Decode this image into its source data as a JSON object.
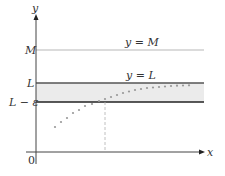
{
  "diagram": {
    "type": "limit-at-infinity-illustration",
    "axes": {
      "x_label": "x",
      "y_label": "y",
      "origin_label": "0"
    },
    "lines": {
      "M": {
        "axis_label": "M",
        "line_label": "y = M",
        "color": "#b0b0b0"
      },
      "L": {
        "axis_label": "L",
        "line_label": "y = L",
        "color": "#444444"
      },
      "L_minus_eps": {
        "axis_label": "L − ε",
        "color": "#222222"
      }
    },
    "band_fill": "#ebebeb",
    "dot_color": "#999999",
    "dashed_line_color": "#aaaaaa"
  }
}
